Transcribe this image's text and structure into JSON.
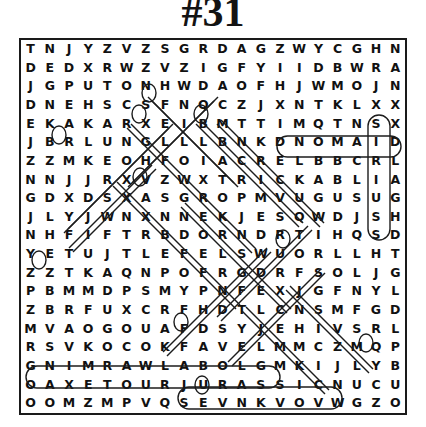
{
  "puzzle": {
    "title": "#31",
    "rows": 18,
    "cols": 19,
    "grid": [
      [
        "T",
        "N",
        "J",
        "Y",
        "Z",
        "V",
        "Z",
        "S",
        "G",
        "R",
        "D",
        "A",
        "G",
        "Z",
        "W",
        "Y",
        "C",
        "G",
        "H",
        "N"
      ],
      [
        "D",
        "E",
        "D",
        "X",
        "R",
        "W",
        "Z",
        "V",
        "Z",
        "I",
        "G",
        "F",
        "Y",
        "I",
        "I",
        "D",
        "B",
        "W",
        "R",
        "A"
      ],
      [
        "J",
        "G",
        "P",
        "U",
        "T",
        "O",
        "N",
        "H",
        "W",
        "D",
        "A",
        "O",
        "F",
        "H",
        "J",
        "W",
        "M",
        "O",
        "J",
        "N"
      ],
      [
        "D",
        "N",
        "E",
        "H",
        "S",
        "C",
        "S",
        "F",
        "N",
        "Q",
        "C",
        "Z",
        "J",
        "X",
        "N",
        "T",
        "K",
        "L",
        "X",
        "X"
      ],
      [
        "E",
        "K",
        "A",
        "K",
        "A",
        "R",
        "X",
        "E",
        "I",
        "B",
        "M",
        "T",
        "T",
        "I",
        "M",
        "Q",
        "T",
        "N",
        "S",
        "X"
      ],
      [
        "J",
        "B",
        "R",
        "L",
        "U",
        "N",
        "G",
        "L",
        "L",
        "L",
        "B",
        "N",
        "K",
        "D",
        "N",
        "O",
        "M",
        "A",
        "I",
        "D"
      ],
      [
        "Z",
        "Z",
        "M",
        "K",
        "E",
        "O",
        "H",
        "F",
        "O",
        "I",
        "A",
        "C",
        "R",
        "E",
        "L",
        "B",
        "B",
        "C",
        "R",
        "L"
      ],
      [
        "N",
        "N",
        "J",
        "J",
        "R",
        "X",
        "V",
        "Z",
        "W",
        "X",
        "T",
        "R",
        "I",
        "C",
        "K",
        "A",
        "B",
        "L",
        "I",
        "A"
      ],
      [
        "G",
        "D",
        "X",
        "D",
        "S",
        "X",
        "A",
        "S",
        "G",
        "R",
        "O",
        "P",
        "M",
        "V",
        "U",
        "G",
        "U",
        "S",
        "U",
        "G"
      ],
      [
        "J",
        "L",
        "Y",
        "J",
        "W",
        "N",
        "X",
        "N",
        "N",
        "E",
        "K",
        "J",
        "E",
        "S",
        "Q",
        "W",
        "D",
        "J",
        "S",
        "H"
      ],
      [
        "N",
        "H",
        "F",
        "I",
        "F",
        "T",
        "R",
        "B",
        "D",
        "O",
        "R",
        "N",
        "D",
        "R",
        "T",
        "I",
        "H",
        "Q",
        "S",
        "D"
      ],
      [
        "Y",
        "E",
        "T",
        "U",
        "J",
        "T",
        "L",
        "E",
        "F",
        "E",
        "L",
        "S",
        "W",
        "U",
        "O",
        "R",
        "L",
        "L",
        "H",
        "T"
      ],
      [
        "Z",
        "Z",
        "T",
        "K",
        "A",
        "Q",
        "N",
        "P",
        "O",
        "F",
        "R",
        "G",
        "D",
        "R",
        "F",
        "S",
        "O",
        "L",
        "J",
        "G"
      ],
      [
        "P",
        "B",
        "M",
        "M",
        "D",
        "P",
        "S",
        "M",
        "Y",
        "P",
        "N",
        "F",
        "E",
        "X",
        "J",
        "G",
        "F",
        "N",
        "Y",
        "L"
      ],
      [
        "Z",
        "B",
        "R",
        "F",
        "U",
        "X",
        "C",
        "R",
        "F",
        "H",
        "D",
        "T",
        "L",
        "C",
        "N",
        "S",
        "M",
        "F",
        "G",
        "D"
      ],
      [
        "M",
        "V",
        "A",
        "O",
        "G",
        "O",
        "U",
        "A",
        "F",
        "D",
        "S",
        "Y",
        "J",
        "E",
        "H",
        "I",
        "V",
        "S",
        "R",
        "L"
      ],
      [
        "R",
        "S",
        "V",
        "K",
        "O",
        "C",
        "O",
        "K",
        "F",
        "A",
        "V",
        "E",
        "L",
        "M",
        "M",
        "C",
        "Z",
        "M",
        "Q",
        "P"
      ],
      [
        "G",
        "N",
        "I",
        "M",
        "R",
        "A",
        "W",
        "L",
        "A",
        "B",
        "O",
        "L",
        "G",
        "M",
        "K",
        "I",
        "J",
        "L",
        "Y",
        "B"
      ],
      [
        "O",
        "A",
        "X",
        "E",
        "T",
        "O",
        "U",
        "R",
        "J",
        "U",
        "R",
        "A",
        "S",
        "S",
        "I",
        "C",
        "N",
        "U",
        "C",
        "U"
      ],
      [
        "O",
        "O",
        "M",
        "Z",
        "M",
        "P",
        "V",
        "Q",
        "S",
        "E",
        "V",
        "N",
        "K",
        "V",
        "O",
        "V",
        "W",
        "G",
        "Z",
        "O"
      ]
    ],
    "found_words": [
      {
        "word": "DIAMOND",
        "display": "DNOMAID",
        "direction": "horizontal-reversed",
        "row": 5,
        "col_start": 13,
        "col_end": 19
      },
      {
        "word": "SIRIUS",
        "display": "SIRIUS",
        "direction": "vertical",
        "col": 18,
        "row_start": 4,
        "row_end": 9
      },
      {
        "word": "GLOBALWARMING",
        "display": "GNIMRAWLABOLG",
        "direction": "horizontal-reversed",
        "row": 17,
        "col_start": 0,
        "col_end": 12
      },
      {
        "word": "JURASSIC",
        "display": "JURASSIC",
        "direction": "horizontal",
        "row": 18,
        "col_start": 8,
        "col_end": 15
      }
    ],
    "colors": {
      "ink": "#111111",
      "border": "#1a1a1a",
      "background": "#ffffff",
      "mark": "#1c1c1c"
    }
  }
}
